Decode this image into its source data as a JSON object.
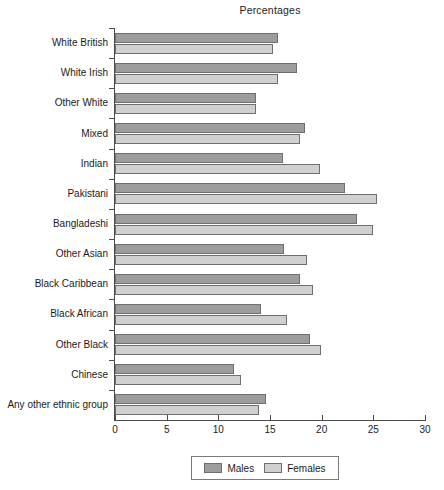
{
  "chart_data": {
    "type": "bar",
    "orientation": "horizontal",
    "title": "Percentages",
    "xlabel": "",
    "ylabel": "",
    "xlim": [
      0,
      30
    ],
    "xticks": [
      0,
      5,
      10,
      15,
      20,
      25,
      30
    ],
    "grid": false,
    "legend_position": "bottom",
    "categories": [
      "White British",
      "White Irish",
      "Other White",
      "Mixed",
      "Indian",
      "Pakistani",
      "Bangladeshi",
      "Other Asian",
      "Black Caribbean",
      "Black African",
      "Other Black",
      "Chinese",
      "Any other ethnic group"
    ],
    "series": [
      {
        "name": "Males",
        "color": "#9d9d9d",
        "values": [
          15.8,
          17.6,
          13.6,
          18.4,
          16.3,
          22.3,
          23.4,
          16.4,
          17.9,
          14.1,
          18.9,
          11.5,
          14.6
        ]
      },
      {
        "name": "Females",
        "color": "#d0d0d0",
        "values": [
          15.3,
          15.8,
          13.6,
          17.9,
          19.8,
          25.4,
          25.0,
          18.6,
          19.2,
          16.6,
          19.9,
          12.2,
          13.9
        ]
      }
    ]
  },
  "legend": {
    "items": [
      {
        "label": "Males"
      },
      {
        "label": "Females"
      }
    ]
  }
}
